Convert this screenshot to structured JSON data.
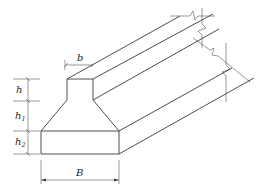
{
  "diagram": {
    "type": "isometric strip footing cross-section",
    "labels": {
      "pedestal_width": "b",
      "base_width": "B",
      "pedestal_height": "h",
      "slope_height": "h",
      "slope_height_sub": "1",
      "base_height": "h",
      "base_height_sub": "2"
    },
    "colors": {
      "line": "#3a3a3a",
      "background": "#ffffff"
    }
  }
}
